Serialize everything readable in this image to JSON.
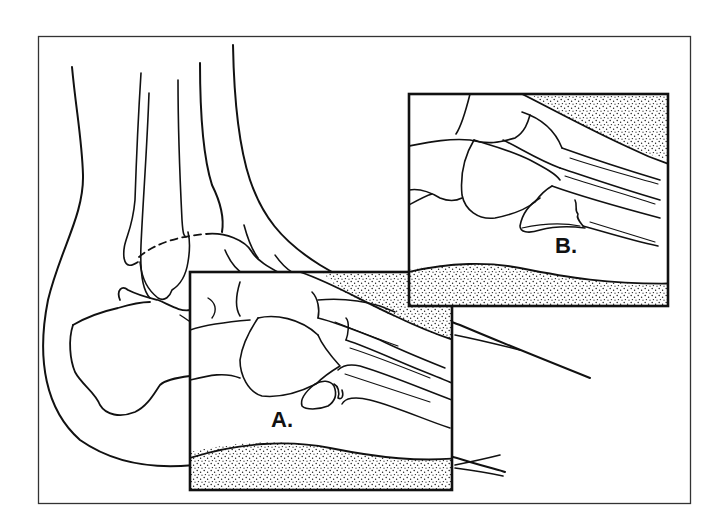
{
  "figure": {
    "labels": {
      "inset_a": "A.",
      "inset_b": "B."
    },
    "colors": {
      "line": "#111111",
      "background": "#ffffff",
      "stipple": "#222222"
    }
  },
  "caption": {
    "text": ""
  }
}
